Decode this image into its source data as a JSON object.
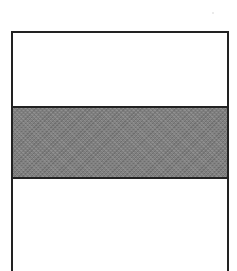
{
  "diagram": {
    "type": "horizontal-band-rectangle",
    "outline_color": "#222222",
    "bands": [
      {
        "position": "top",
        "fill": "#ffffff",
        "pattern": "solid"
      },
      {
        "position": "middle",
        "fill": "#7c7c7c",
        "pattern": "stipple"
      },
      {
        "position": "bottom",
        "fill": "#ffffff",
        "pattern": "solid"
      }
    ],
    "text": []
  }
}
